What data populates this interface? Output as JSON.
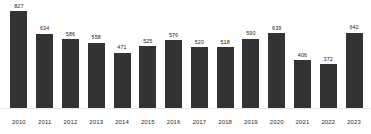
{
  "chart_data": {
    "type": "bar",
    "title": "",
    "subtitle": "",
    "xlabel": "",
    "ylabel": "",
    "categories": [
      "2010",
      "2011",
      "2012",
      "2013",
      "2014",
      "2015",
      "2016",
      "2017",
      "2018",
      "2019",
      "2020",
      "2021",
      "2022",
      "2023"
    ],
    "values": [
      827,
      634,
      586,
      558,
      471,
      525,
      576,
      520,
      518,
      590,
      639,
      406,
      372,
      642
    ],
    "value_labels": [
      "827",
      "634",
      "586",
      "558",
      "471",
      "525",
      "576",
      "520",
      "518",
      "590",
      "639",
      "406",
      "372",
      "642"
    ],
    "ylim": [
      0,
      880
    ],
    "grid": false,
    "legend": false,
    "legend_position": "none",
    "bar_color": "#333333",
    "label_color": "#1a1a1a",
    "axis_color": "#e8e8e8",
    "background": "#ffffff",
    "data_labels_shown": true
  }
}
